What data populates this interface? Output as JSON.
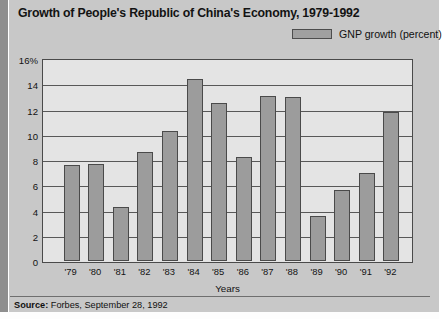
{
  "figure": {
    "title": "Growth of People's Republic of China's Economy, 1979-1992",
    "source_label": "Source:",
    "source_text": " Forbes, September 28, 1992"
  },
  "legend": {
    "entries": [
      {
        "label": "GNP growth (percent)",
        "color": "#9c9c9c",
        "swatch_icon": "legend-swatch-icon"
      }
    ]
  },
  "colors": {
    "figure_background": "#c8c8c8",
    "plot_background": "#e4e4e4",
    "bar_fill": "#9c9c9c",
    "bar_outline": "#4a4a4a",
    "gridline": "#585858",
    "text": "#131313"
  },
  "chart_data": {
    "type": "bar",
    "title": "Growth of People's Republic of China's Economy, 1979-1992",
    "xlabel": "Years",
    "ylabel": "",
    "categories": [
      "'79",
      "'80",
      "'81",
      "'82",
      "'83",
      "'84",
      "'85",
      "'86",
      "'87",
      "'88",
      "'89",
      "'90",
      "'91",
      "'92"
    ],
    "values": [
      7.6,
      7.7,
      4.3,
      8.6,
      10.3,
      14.4,
      12.5,
      8.2,
      13.1,
      13.0,
      3.6,
      5.6,
      7.0,
      11.8
    ],
    "series": [
      {
        "name": "GNP growth (percent)",
        "values": [
          7.6,
          7.7,
          4.3,
          8.6,
          10.3,
          14.4,
          12.5,
          8.2,
          13.1,
          13.0,
          3.6,
          5.6,
          7.0,
          11.8
        ]
      }
    ],
    "ylim": [
      0,
      16
    ],
    "ytick_values": [
      0,
      2,
      4,
      6,
      8,
      10,
      12,
      14,
      16
    ],
    "ytick_labels": [
      "0",
      "2",
      "4",
      "6",
      "8",
      "10",
      "12",
      "14",
      "16%"
    ],
    "grid": "horizontal",
    "legend_position": "top-right"
  }
}
